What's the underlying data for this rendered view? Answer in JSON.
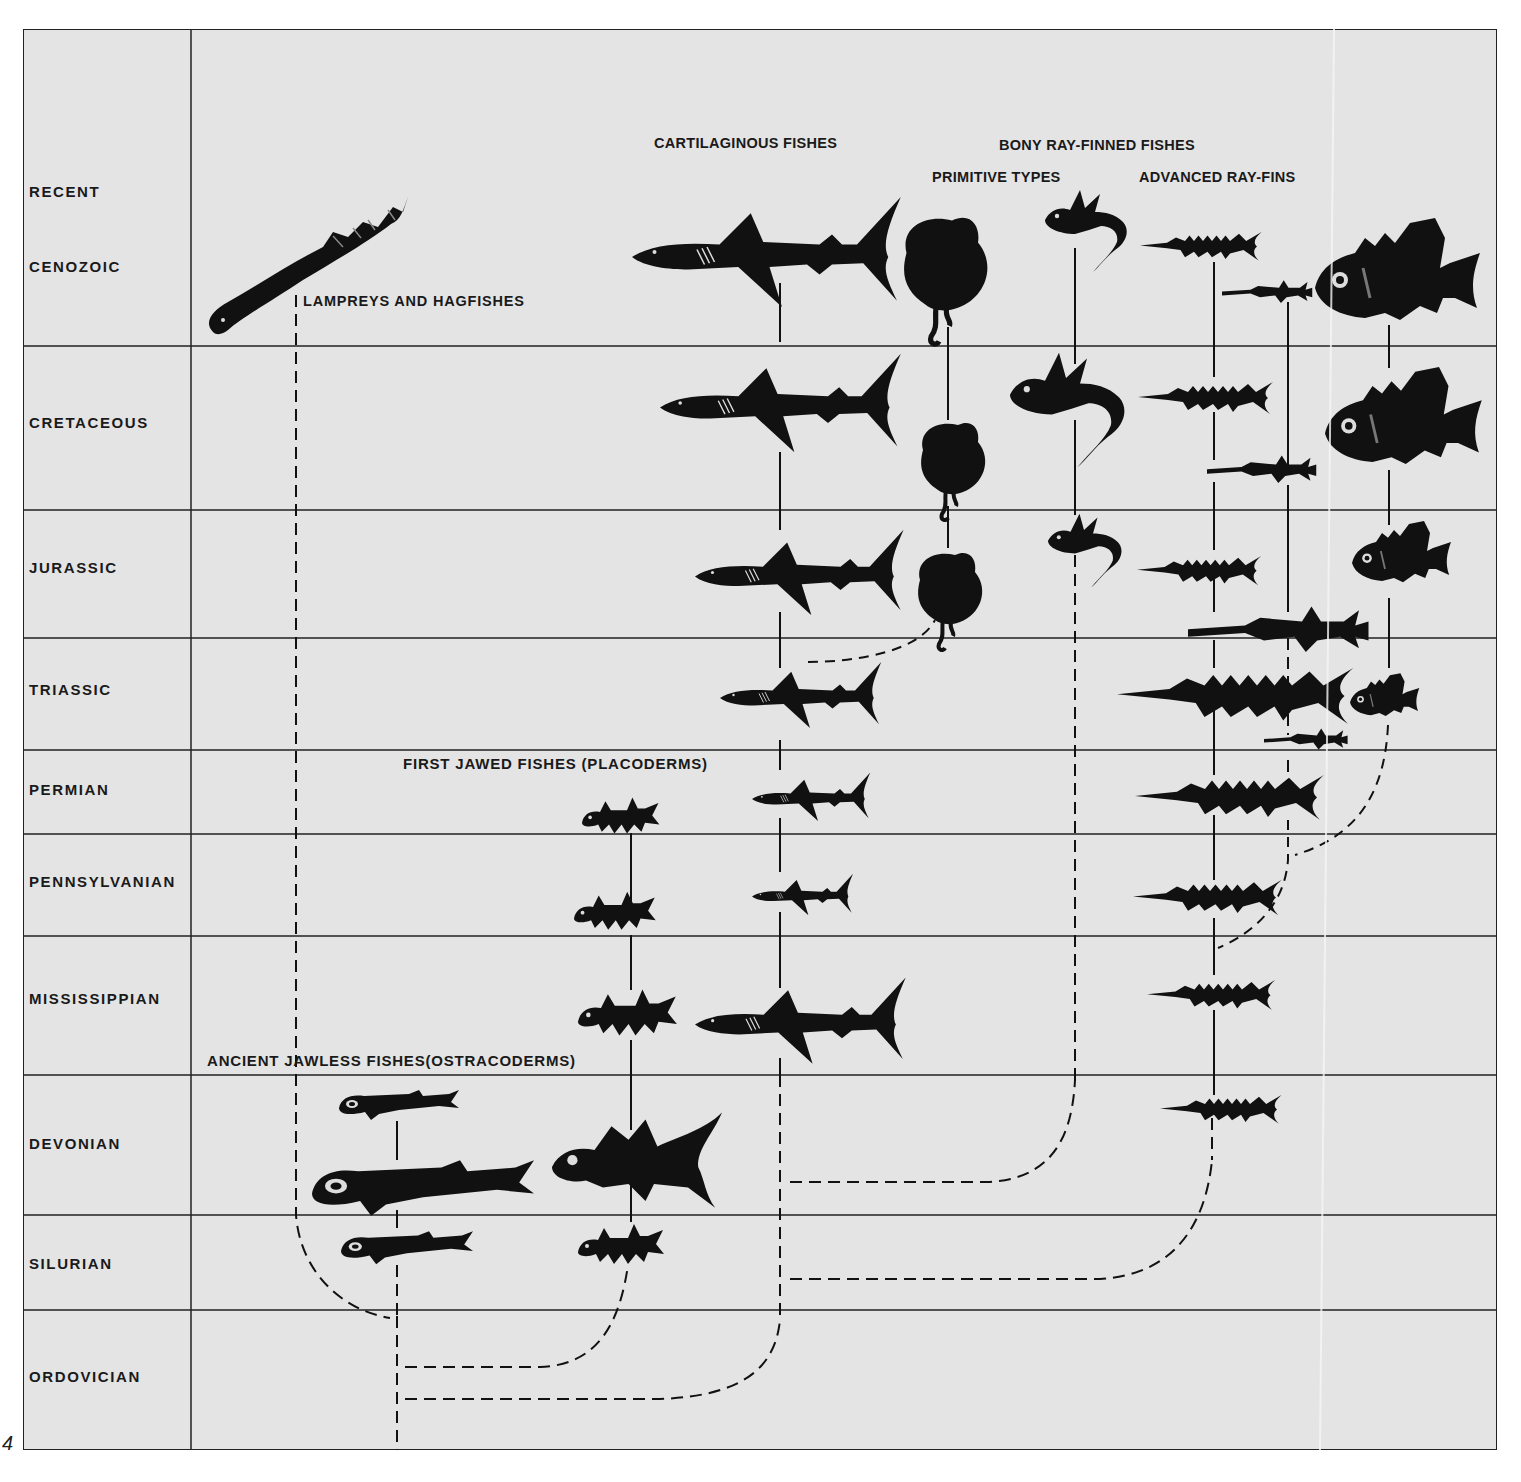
{
  "page_number": "4",
  "periods": [
    {
      "label": "RECENT",
      "y": 191
    },
    {
      "label": "CENOZOIC",
      "y": 266
    },
    {
      "label": "CRETACEOUS",
      "y": 422
    },
    {
      "label": "JURASSIC",
      "y": 567
    },
    {
      "label": "TRIASSIC",
      "y": 689
    },
    {
      "label": "PERMIAN",
      "y": 789
    },
    {
      "label": "PENNSYLVANIAN",
      "y": 881
    },
    {
      "label": "MISSISSIPPIAN",
      "y": 998
    },
    {
      "label": "DEVONIAN",
      "y": 1143
    },
    {
      "label": "SILURIAN",
      "y": 1263
    },
    {
      "label": "ORDOVICIAN",
      "y": 1376
    }
  ],
  "row_boundaries": [
    346,
    510,
    638,
    750,
    834,
    936,
    1075,
    1215,
    1310
  ],
  "groups": {
    "cartilaginous": "CARTILAGINOUS FISHES",
    "bony": "BONY RAY-FINNED FISHES",
    "primitive": "PRIMITIVE TYPES",
    "advanced": "ADVANCED RAY-FINS",
    "lampreys": "LAMPREYS AND HAGFISHES",
    "placoderms": "FIRST JAWED FISHES (PLACODERMS)",
    "ostracoderms": "ANCIENT JAWLESS FISHES(OSTRACODERMS)"
  },
  "colors": {
    "background": "#e4e4e4",
    "ink": "#111111",
    "grid": "#222222"
  }
}
